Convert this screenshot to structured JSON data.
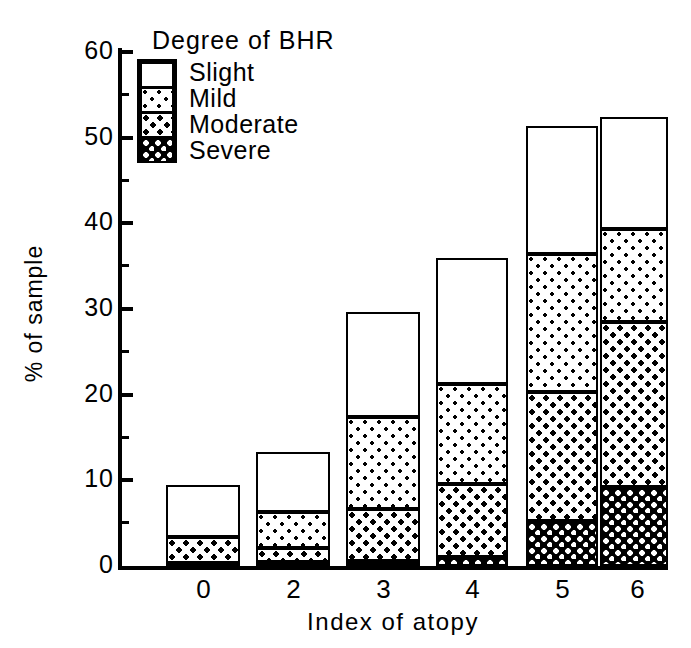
{
  "chart_data": {
    "type": "bar",
    "subtype": "stacked-bar",
    "title": "",
    "xlabel": "Index of atopy",
    "ylabel": "% of sample",
    "categories": [
      "0",
      "2",
      "3",
      "4",
      "5",
      "6"
    ],
    "ylim": [
      0,
      60
    ],
    "ytick_labels": [
      "0",
      "10",
      "20",
      "30",
      "40",
      "50",
      "60"
    ],
    "ytick_values": [
      0,
      10,
      20,
      30,
      40,
      50,
      60
    ],
    "minor_ticks": [
      5,
      15,
      25,
      35,
      45,
      55
    ],
    "grid": false,
    "legend_title": "Degree of BHR",
    "legend_position": "upper-left-inside",
    "stack_order_bottom_to_top": [
      "Severe",
      "Moderate",
      "Mild",
      "Slight"
    ],
    "series": [
      {
        "name": "Severe",
        "pattern": "dense-crosshatch",
        "values": [
          0.4,
          0.5,
          0.6,
          1.0,
          5.3,
          9.2
        ]
      },
      {
        "name": "Moderate",
        "pattern": "medium-dots",
        "values": [
          3.0,
          1.6,
          6.1,
          8.6,
          15.0,
          19.3
        ]
      },
      {
        "name": "Mild",
        "pattern": "sparse-dots",
        "values": [
          0.0,
          4.2,
          10.7,
          11.6,
          16.1,
          10.8
        ]
      },
      {
        "name": "Slight",
        "pattern": "white",
        "values": [
          6.1,
          7.0,
          12.2,
          14.8,
          15.0,
          13.1
        ]
      }
    ],
    "totals": [
      9.5,
      13.3,
      29.6,
      36.0,
      51.4,
      52.4
    ]
  },
  "legend": {
    "title": "Degree of BHR",
    "entries": [
      {
        "label": "Slight"
      },
      {
        "label": "Mild"
      },
      {
        "label": "Moderate"
      },
      {
        "label": "Severe"
      }
    ]
  },
  "axes": {
    "x_title": "Index of atopy",
    "y_title": "% of sample",
    "y_ticks": [
      "60",
      "50",
      "40",
      "30",
      "20",
      "10",
      "0"
    ],
    "x_ticks": [
      "0",
      "2",
      "3",
      "4",
      "5",
      "6"
    ]
  },
  "colors": {
    "ink": "#000000",
    "paper": "#ffffff"
  }
}
